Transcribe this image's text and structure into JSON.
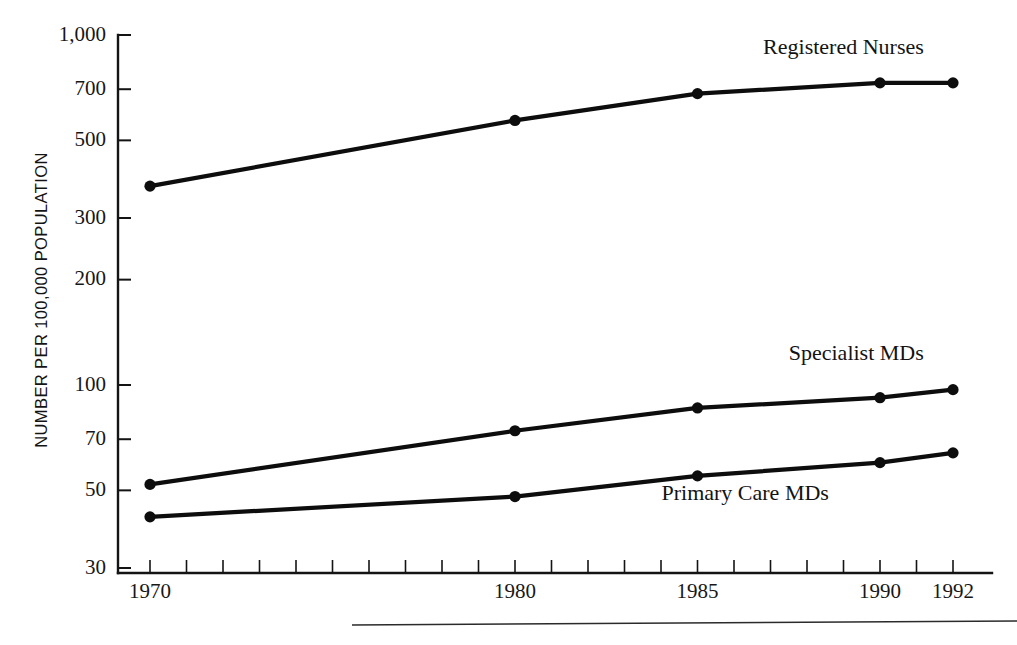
{
  "figure": {
    "background_color": "#ffffff",
    "ink_color": "#0d0d0d"
  },
  "chart_data": {
    "type": "line",
    "title": "",
    "subtitle": "",
    "xlabel": "",
    "ylabel": "NUMBER PER 100,000 POPULATION",
    "x": [
      1970,
      1980,
      1985,
      1990,
      1992
    ],
    "categories": [
      "1970",
      "1980",
      "1985",
      "1990",
      "1992"
    ],
    "xtick_labels": [
      "1970",
      "1980",
      "1985",
      "1990",
      "1992"
    ],
    "xtick_values": [
      1970,
      1980,
      1985,
      1990,
      1992
    ],
    "xlim": [
      1970,
      1992.8
    ],
    "x_minor_ticks_every_year": true,
    "yscale": "log",
    "ylim": [
      30,
      1000
    ],
    "ytick_labels": [
      "1,000",
      "700",
      "500",
      "300",
      "200",
      "100",
      "70",
      "50",
      "30"
    ],
    "ytick_values": [
      1000,
      700,
      500,
      300,
      200,
      100,
      70,
      50,
      30
    ],
    "grid": false,
    "legend_position": "inline-right-of-line",
    "marker": "filled-circle",
    "series": [
      {
        "name": "Registered Nurses",
        "label": "Registered Nurses",
        "label_anchor_x": 1991.2,
        "label_anchor_y": 880,
        "values": [
          370,
          570,
          680,
          730,
          730
        ]
      },
      {
        "name": "Specialist MDs",
        "label": "Specialist MDs",
        "label_anchor_x": 1991.2,
        "label_anchor_y": 118,
        "values": [
          52,
          74,
          86,
          92,
          97
        ]
      },
      {
        "name": "Primary Care MDs",
        "label": "Primary Care MDs",
        "label_anchor_x": 1988.6,
        "label_anchor_y": 47,
        "values": [
          42,
          48,
          55,
          60,
          64
        ]
      }
    ]
  }
}
